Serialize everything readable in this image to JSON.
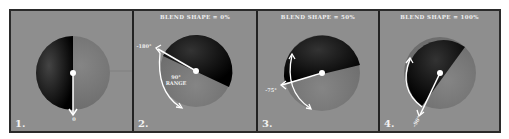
{
  "panels": [
    {
      "number": "1.",
      "title": "",
      "angle_label": "0",
      "range_label": ""
    },
    {
      "number": "2.",
      "title": "BLEND SHAPE = 0%",
      "angle_label": "-180°",
      "range_label": "90°\nRANGE"
    },
    {
      "number": "3.",
      "title": "BLEND SHAPE = 50%",
      "angle_label": "-75°",
      "range_label": ""
    },
    {
      "number": "4.",
      "title": "BLEND SHAPE = 100%",
      "angle_label": "-90°",
      "range_label": ""
    }
  ],
  "colors": {
    "background": "#8e8e8e",
    "sphere_dark": "#0a0a0a",
    "sphere_light": "#7a7a7a",
    "arrow": "#ffffff",
    "border": "#222222"
  }
}
